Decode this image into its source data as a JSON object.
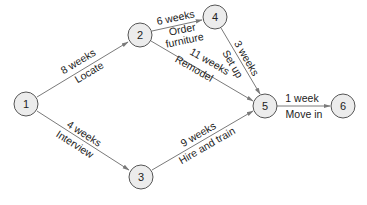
{
  "diagram": {
    "type": "activity-network",
    "nodes": [
      {
        "id": "1",
        "label": "1",
        "x": 26,
        "y": 104
      },
      {
        "id": "2",
        "label": "2",
        "x": 140,
        "y": 35
      },
      {
        "id": "3",
        "label": "3",
        "x": 141,
        "y": 177
      },
      {
        "id": "4",
        "label": "4",
        "x": 215,
        "y": 17
      },
      {
        "id": "5",
        "label": "5",
        "x": 265,
        "y": 106
      },
      {
        "id": "6",
        "label": "6",
        "x": 343,
        "y": 106
      }
    ],
    "edges": [
      {
        "from": "1",
        "to": "2",
        "duration": "8 weeks",
        "activity": "Locate"
      },
      {
        "from": "1",
        "to": "3",
        "duration": "4 weeks",
        "activity": "Interview"
      },
      {
        "from": "2",
        "to": "4",
        "duration": "6 weeks",
        "activity_line1": "Order",
        "activity_line2": "furniture"
      },
      {
        "from": "2",
        "to": "5",
        "duration": "11 weeks",
        "activity": "Remodel"
      },
      {
        "from": "4",
        "to": "5",
        "duration": "3 weeks",
        "activity": "Set up"
      },
      {
        "from": "3",
        "to": "5",
        "duration": "9 weeks",
        "activity": "Hire and train"
      },
      {
        "from": "5",
        "to": "6",
        "duration": "1 week",
        "activity": "Move in"
      }
    ]
  }
}
